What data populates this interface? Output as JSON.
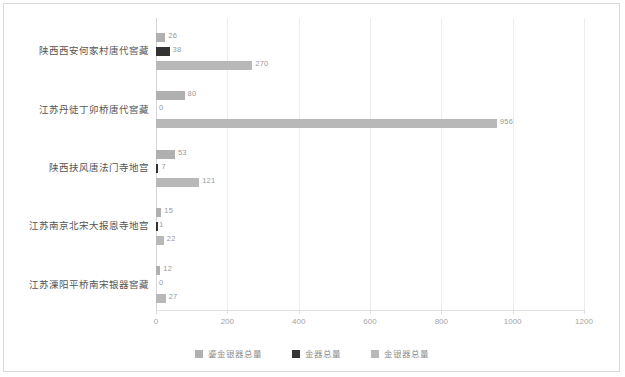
{
  "chart_data": {
    "type": "bar",
    "orientation": "horizontal",
    "title": "",
    "xlabel": "",
    "ylabel": "",
    "xlim": [
      0,
      1200
    ],
    "xticks": [
      0,
      200,
      400,
      600,
      800,
      1000,
      1200
    ],
    "grid": true,
    "legend_position": "bottom",
    "categories": [
      "陕西西安何家村唐代窖藏",
      "江苏丹徒丁卯桥唐代窖藏",
      "陕西扶风唐法门寺地宫",
      "江苏南京北宋大报恩寺地宫",
      "江苏溧阳平桥南宋银器窖藏"
    ],
    "series": [
      {
        "name": "鎏金银器总量",
        "color": "#b0b0b0",
        "values": [
          26,
          80,
          53,
          15,
          12
        ]
      },
      {
        "name": "金器总量",
        "color": "#333333",
        "values": [
          38,
          0,
          7,
          1,
          0
        ]
      },
      {
        "name": "金银器总量",
        "color": "#b8b8b8",
        "values": [
          270,
          956,
          121,
          22,
          27
        ]
      }
    ]
  },
  "axis": {
    "tick_labels": [
      "0",
      "200",
      "400",
      "600",
      "800",
      "1000",
      "1200"
    ]
  },
  "legend": {
    "items": [
      {
        "label": "鎏金银器总量",
        "color": "#b0b0b0"
      },
      {
        "label": "金器总量",
        "color": "#333333"
      },
      {
        "label": "金银器总量",
        "color": "#b8b8b8"
      }
    ]
  },
  "values_text": {
    "g0": [
      "26",
      "38",
      "270"
    ],
    "g1": [
      "80",
      "0",
      "956"
    ],
    "g2": [
      "53",
      "7",
      "121"
    ],
    "g3": [
      "15",
      "1",
      "22"
    ],
    "g4": [
      "12",
      "0",
      "27"
    ]
  }
}
